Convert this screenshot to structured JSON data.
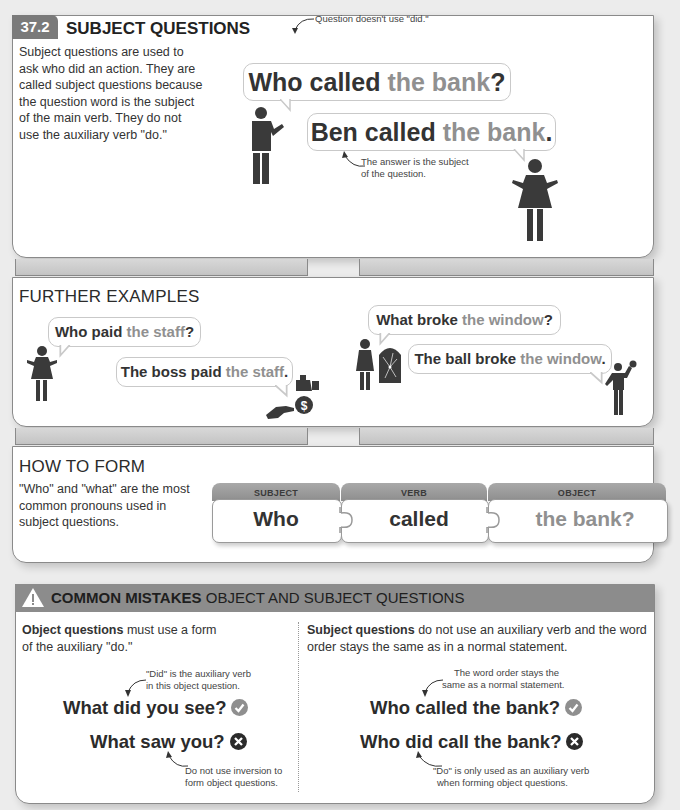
{
  "section": {
    "number": "37.2",
    "title": "SUBJECT QUESTIONS",
    "intro": "Subject questions are used to ask who did an action. They are called subject questions because the question word is the subject of the main verb. They do not use the auxiliary verb \"do.\"",
    "note_top": "Question doesn't use \"did.\"",
    "question": {
      "bold": "Who called ",
      "light": "the bank",
      "end": "?"
    },
    "answer": {
      "bold": "Ben called ",
      "light": "the bank",
      "end": "."
    },
    "note_bottom_1": "The answer is the subject",
    "note_bottom_2": "of the question."
  },
  "further_examples": {
    "title": "FURTHER EXAMPLES",
    "example1": {
      "question": {
        "bold": "Who paid ",
        "light": "the staff",
        "end": "?"
      },
      "answer": {
        "bold": "The boss paid ",
        "light": "the staff",
        "end": "."
      }
    },
    "example2": {
      "question": {
        "bold": "What broke ",
        "light": "the window",
        "end": "?"
      },
      "answer": {
        "bold": "The ball broke ",
        "light": "the window",
        "end": "."
      }
    }
  },
  "how_to_form": {
    "title": "HOW TO FORM",
    "text": "\"Who\" and \"what\" are the most common pronouns used in subject questions.",
    "pieces": [
      {
        "label": "SUBJECT",
        "word": "Who"
      },
      {
        "label": "VERB",
        "word": "called"
      },
      {
        "label": "OBJECT",
        "word": "the bank?"
      }
    ]
  },
  "common_mistakes": {
    "title_bold": "COMMON MISTAKES",
    "title_rest": " OBJECT AND SUBJECT QUESTIONS",
    "left": {
      "intro_bold": "Object questions",
      "intro_rest_1": " must use a form",
      "intro_rest_2": "of the auxiliary \"do.\"",
      "note_top_1": "\"Did\" is the auxiliary verb",
      "note_top_2": "in this object question.",
      "correct": "What did you see?",
      "wrong": "What saw you?",
      "note_bottom_1": "Do not use inversion to",
      "note_bottom_2": "form object questions."
    },
    "right": {
      "intro_bold": "Subject questions",
      "intro_rest_1": " do not use an auxiliary verb and the word",
      "intro_rest_2": "order stays the same as in a normal statement.",
      "note_top_1": "The word order stays the",
      "note_top_2": "same as a normal statement.",
      "correct": "Who called the bank?",
      "wrong": "Who did call the bank?",
      "note_bottom_1": "\"Do\" is only used as an auxiliary verb",
      "note_bottom_2": "when forming object questions."
    }
  },
  "colors": {
    "badge": "#7a7a7a",
    "light_text": "#909090",
    "mistakes_header": "#8c8c8c",
    "check": "#8f8f8f",
    "cross": "#2b2b2b"
  }
}
